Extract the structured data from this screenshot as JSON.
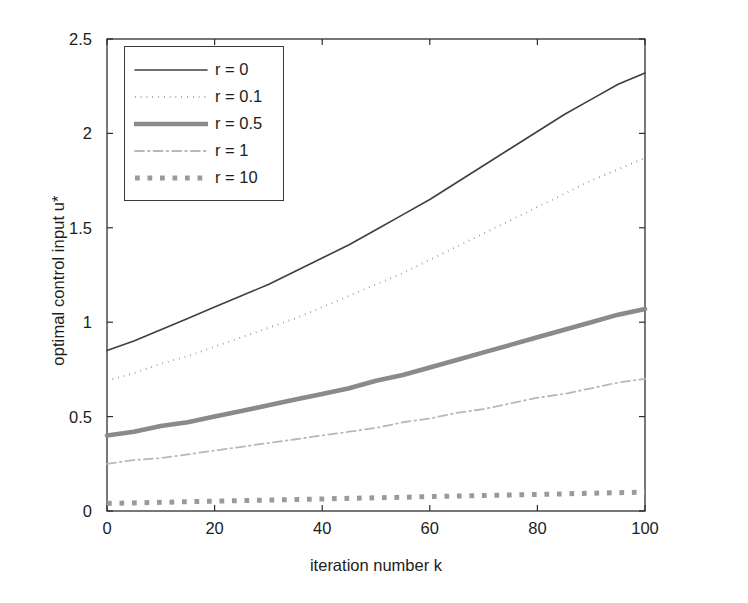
{
  "chart_data": {
    "type": "line",
    "title": "",
    "xlabel": "iteration number k",
    "ylabel": "optimal control input u*",
    "xlim": [
      0,
      100
    ],
    "ylim": [
      0,
      2.5
    ],
    "xticks": [
      "0",
      "20",
      "40",
      "60",
      "80",
      "100"
    ],
    "xtick_values": [
      0,
      20,
      40,
      60,
      80,
      100
    ],
    "yticks": [
      "0",
      "0.5",
      "1",
      "1.5",
      "2",
      "2.5"
    ],
    "ytick_values": [
      0,
      0.5,
      1,
      1.5,
      2,
      2.5
    ],
    "grid": false,
    "legend_position": "upper left",
    "x": [
      0,
      5,
      10,
      15,
      20,
      25,
      30,
      35,
      40,
      45,
      50,
      55,
      60,
      65,
      70,
      75,
      80,
      85,
      90,
      95,
      100
    ],
    "series": [
      {
        "name": "r = 0",
        "style": "solid",
        "width": 1.6,
        "color": "#3f3f3f",
        "values": [
          0.85,
          0.9,
          0.96,
          1.02,
          1.08,
          1.14,
          1.2,
          1.27,
          1.34,
          1.41,
          1.49,
          1.57,
          1.65,
          1.74,
          1.83,
          1.92,
          2.01,
          2.1,
          2.18,
          2.26,
          2.32
        ]
      },
      {
        "name": "r = 0.1",
        "style": "dotted",
        "width": 2.0,
        "color": "#7a7a7a",
        "values": [
          0.69,
          0.73,
          0.78,
          0.82,
          0.87,
          0.92,
          0.97,
          1.02,
          1.08,
          1.14,
          1.2,
          1.26,
          1.33,
          1.4,
          1.47,
          1.54,
          1.61,
          1.68,
          1.75,
          1.81,
          1.87
        ]
      },
      {
        "name": "r = 0.5",
        "style": "solid",
        "width": 4.6,
        "color": "#8a8a8a",
        "values": [
          0.4,
          0.42,
          0.45,
          0.47,
          0.5,
          0.53,
          0.56,
          0.59,
          0.62,
          0.65,
          0.69,
          0.72,
          0.76,
          0.8,
          0.84,
          0.88,
          0.92,
          0.96,
          1.0,
          1.04,
          1.07
        ]
      },
      {
        "name": "r = 1",
        "style": "dashdot",
        "width": 1.8,
        "color": "#b8b8b8",
        "values": [
          0.25,
          0.27,
          0.28,
          0.3,
          0.32,
          0.34,
          0.36,
          0.38,
          0.4,
          0.42,
          0.44,
          0.47,
          0.49,
          0.52,
          0.54,
          0.57,
          0.6,
          0.62,
          0.65,
          0.68,
          0.7
        ]
      },
      {
        "name": "r = 10",
        "style": "dotted",
        "width": 5.0,
        "color": "#9a9a9a",
        "values": [
          0.04,
          0.043,
          0.046,
          0.049,
          0.052,
          0.055,
          0.058,
          0.061,
          0.064,
          0.067,
          0.07,
          0.073,
          0.076,
          0.079,
          0.082,
          0.085,
          0.088,
          0.091,
          0.094,
          0.097,
          0.1
        ]
      }
    ]
  },
  "legend": {
    "entries": [
      {
        "label": "r = 0"
      },
      {
        "label": "r = 0.1"
      },
      {
        "label": "r = 0.5"
      },
      {
        "label": "r = 1"
      },
      {
        "label": "r = 10"
      }
    ]
  },
  "axes": {
    "frame_color": "#2e2e2e"
  }
}
